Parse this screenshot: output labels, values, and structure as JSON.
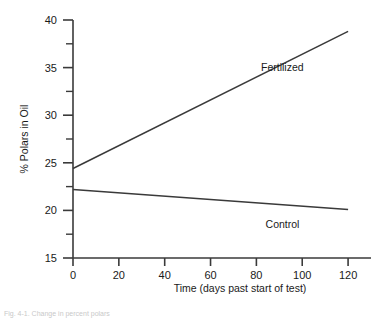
{
  "chart_data": {
    "type": "line",
    "title": "",
    "xlabel": "Time (days past start of test)",
    "ylabel": "% Polars in Oil",
    "xlim": [
      0,
      130
    ],
    "ylim": [
      15,
      40
    ],
    "xticks": [
      0,
      20,
      40,
      60,
      80,
      100,
      120
    ],
    "xtick_labels": [
      "0",
      "20",
      "40",
      "60",
      "80",
      "100",
      "120"
    ],
    "yticks": [
      15,
      20,
      25,
      30,
      35,
      40
    ],
    "ytick_labels": [
      "15",
      "20",
      "25",
      "30",
      "35",
      "40"
    ],
    "yminor_ticks": [
      17.5,
      22.5,
      27.5,
      32.5,
      37.5
    ],
    "grid": false,
    "legend_position": "inline-annotation",
    "series": [
      {
        "name": "Fertilized",
        "label": "Fertilized",
        "x": [
          0,
          120
        ],
        "values": [
          24.4,
          38.8
        ],
        "color": "#3a3a3a",
        "label_x": 82,
        "label_y": 34.6
      },
      {
        "name": "Control",
        "label": "Control",
        "x": [
          0,
          120
        ],
        "values": [
          22.2,
          20.1
        ],
        "color": "#3a3a3a",
        "label_x": 84,
        "label_y": 18.2
      }
    ]
  },
  "axes": {
    "x_axis_name": "time-axis",
    "y_axis_name": "polars-axis"
  },
  "caption": {
    "text": "Fig. 4-1. Change in percent polars"
  },
  "colors": {
    "axis": "#3a3a3a",
    "line": "#3a3a3a",
    "text": "#1a1a1a",
    "background": "#ffffff"
  }
}
